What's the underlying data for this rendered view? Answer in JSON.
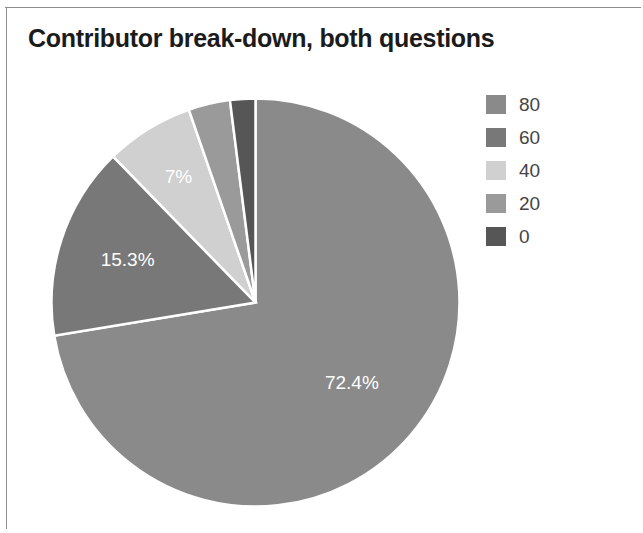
{
  "chart": {
    "title": "Contributor break-down, both questions"
  },
  "legend": {
    "items": [
      {
        "label": "80",
        "color": "#8a8a8a"
      },
      {
        "label": "60",
        "color": "#787878"
      },
      {
        "label": "40",
        "color": "#d0d0d0"
      },
      {
        "label": "20",
        "color": "#9a9a9a"
      },
      {
        "label": "0",
        "color": "#565656"
      }
    ]
  },
  "chart_data": {
    "type": "pie",
    "title": "Contributor break-down, both questions",
    "xlabel": "",
    "ylabel": "",
    "legend_position": "right",
    "grid": false,
    "start_angle_deg": 0,
    "direction": "clockwise",
    "categories": [
      "80",
      "60",
      "40",
      "20",
      "0"
    ],
    "values": [
      72.4,
      15.3,
      7.0,
      3.3,
      2.0
    ],
    "labels": [
      "72.4%",
      "15.3%",
      "7%",
      "",
      ""
    ],
    "colors": [
      "#8a8a8a",
      "#787878",
      "#d0d0d0",
      "#9a9a9a",
      "#565656"
    ],
    "slices": [
      {
        "name": "80",
        "value": 72.4,
        "label": "72.4%",
        "color": "#8a8a8a",
        "label_shown": true
      },
      {
        "name": "60",
        "value": 15.3,
        "label": "15.3%",
        "color": "#787878",
        "label_shown": true
      },
      {
        "name": "40",
        "value": 7.0,
        "label": "7%",
        "color": "#d0d0d0",
        "label_shown": true
      },
      {
        "name": "20",
        "value": 3.3,
        "label": "",
        "color": "#9a9a9a",
        "label_shown": false
      },
      {
        "name": "0",
        "value": 2.0,
        "label": "",
        "color": "#565656",
        "label_shown": false
      }
    ]
  }
}
